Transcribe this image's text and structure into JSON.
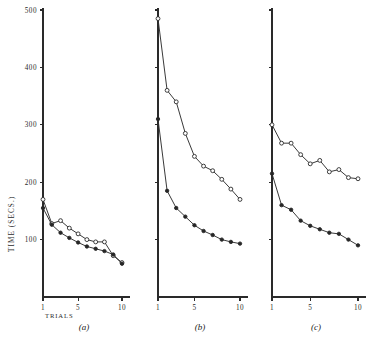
{
  "figure": {
    "y_axis_title": "TIME  (SECS.)",
    "x_axis_title": "TRIALS",
    "y_tick_labels": [
      "500",
      "400",
      "300",
      "200",
      "100"
    ],
    "x_tick_labels": [
      "1",
      "5",
      "10"
    ],
    "panel_captions": [
      "(a)",
      "(b)",
      "(c)"
    ],
    "line_color": "#2e2e2e",
    "axis_color": "#2a2a2a",
    "open_marker_fill": "#ffffff",
    "filled_marker_fill": "#262626",
    "background": "#ffffff"
  },
  "chart_data": [
    {
      "type": "line",
      "title": "(a)",
      "xlabel": "TRIALS",
      "ylabel": "TIME (SECS.)",
      "x": [
        1,
        2,
        3,
        4,
        5,
        6,
        7,
        8,
        9,
        10
      ],
      "xlim": [
        1,
        10
      ],
      "ylim": [
        0,
        500
      ],
      "grid": false,
      "legend": "none",
      "series": [
        {
          "name": "open-circle",
          "marker": "open",
          "values": [
            170,
            128,
            133,
            120,
            110,
            100,
            96,
            96,
            72,
            60
          ]
        },
        {
          "name": "filled-circle",
          "marker": "filled",
          "values": [
            155,
            126,
            112,
            103,
            95,
            88,
            84,
            80,
            74,
            58
          ]
        }
      ]
    },
    {
      "type": "line",
      "title": "(b)",
      "xlabel": "TRIALS",
      "ylabel": "TIME (SECS.)",
      "x": [
        1,
        2,
        3,
        4,
        5,
        6,
        7,
        8,
        9,
        10
      ],
      "xlim": [
        1,
        10
      ],
      "ylim": [
        0,
        500
      ],
      "grid": false,
      "legend": "none",
      "series": [
        {
          "name": "open-circle",
          "marker": "open",
          "values": [
            485,
            360,
            340,
            285,
            245,
            228,
            220,
            205,
            188,
            170
          ]
        },
        {
          "name": "filled-circle",
          "marker": "filled",
          "values": [
            310,
            185,
            155,
            140,
            125,
            115,
            108,
            100,
            96,
            93
          ]
        }
      ]
    },
    {
      "type": "line",
      "title": "(c)",
      "xlabel": "TRIALS",
      "ylabel": "TIME (SECS.)",
      "x": [
        1,
        2,
        3,
        4,
        5,
        6,
        7,
        8,
        9,
        10
      ],
      "xlim": [
        1,
        10
      ],
      "ylim": [
        0,
        500
      ],
      "grid": false,
      "legend": "none",
      "series": [
        {
          "name": "open-circle",
          "marker": "open",
          "values": [
            300,
            268,
            268,
            248,
            232,
            238,
            218,
            222,
            208,
            206
          ]
        },
        {
          "name": "filled-circle",
          "marker": "filled",
          "values": [
            215,
            160,
            152,
            133,
            124,
            118,
            112,
            110,
            100,
            90
          ]
        }
      ]
    }
  ]
}
